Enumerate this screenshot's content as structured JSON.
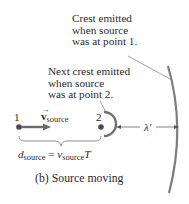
{
  "diagram": {
    "annotation_point1": [
      "Crest emitted",
      "when source",
      "was at point 1."
    ],
    "annotation_point2": [
      "Next crest emitted",
      "when source",
      "was at point 2."
    ],
    "point1_label": "1",
    "point2_label": "2",
    "velocity_symbol": "v",
    "velocity_subscript": "source",
    "wavelength_label": "λ′",
    "distance_eq": {
      "lhs_symbol": "d",
      "lhs_sub": "source",
      "equals": "=",
      "rhs_symbol": "v",
      "rhs_sub": "source",
      "rhs_tail": "T"
    },
    "caption": "(b) Source moving"
  },
  "colors": {
    "crest": "#7a7a7a",
    "arrow_velocity": "#6b6b6b",
    "point": "#4a4a4a",
    "text": "#2a2a2a",
    "leader": "#8a8a8a"
  }
}
